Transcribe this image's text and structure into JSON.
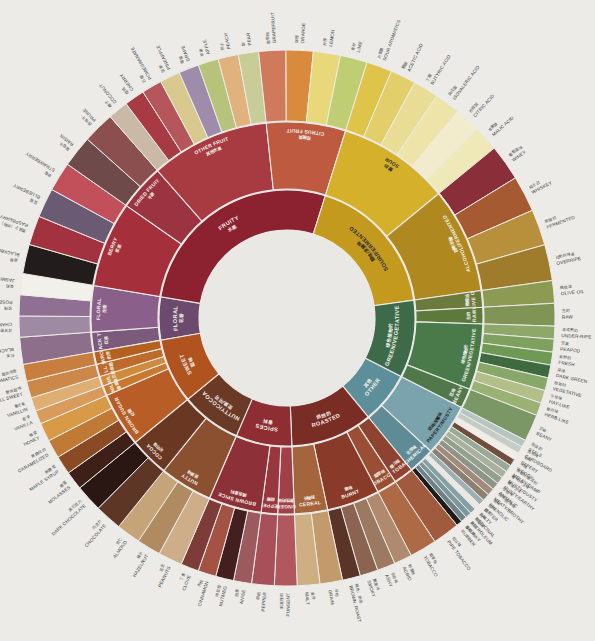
{
  "page": {
    "background_color": "#ecebe8",
    "hub_color": "#e9e8e4",
    "center_x": 287,
    "center_y": 318,
    "ring1_inner_radius": 88,
    "ring1_outer_radius": 128,
    "ring2_inner_radius": 129,
    "ring2_outer_radius": 196,
    "ring3_inner_radius": 197,
    "ring3_outer_radius": 268
  },
  "chart_data": {
    "type": "pie",
    "legend": "none",
    "grid": false,
    "rings": 3,
    "start_angle_deg": -100,
    "categories": [
      "FLORAL",
      "FRUITY",
      "SOUR/FERMENTED",
      "GREEN/VEGETATIVE",
      "OTHER",
      "ROASTED",
      "SPICES",
      "NUTTY/COCOA",
      "SWEET"
    ],
    "values": [
      20,
      100,
      66,
      36,
      24,
      38,
      26,
      28,
      30
    ],
    "xlabel": "",
    "ylabel": ""
  },
  "wheel": {
    "ring1": [
      {
        "en": "FLORAL",
        "zh": "花香",
        "color": "#6c4a6e",
        "span": 20,
        "children": [
          {
            "en": "BLACK TEA",
            "zh": "红茶",
            "color": "#7c5a7c",
            "span": 6,
            "leaves": [
              {
                "en": "BLACK TEA",
                "zh": "红茶",
                "color": "#8d6f8c"
              }
            ]
          },
          {
            "en": "FLORAL",
            "zh": "花香",
            "color": "#8a5f8a",
            "span": 14,
            "leaves": [
              {
                "en": "CHAMOMILE",
                "zh": "洋甘菊",
                "color": "#9e8aa2"
              },
              {
                "en": "ROSE",
                "zh": "玫瑰",
                "color": "#8f6f92"
              },
              {
                "en": "JASMINE",
                "zh": "茉莉",
                "color": "#f2f0ea"
              }
            ]
          }
        ]
      },
      {
        "en": "FRUITY",
        "zh": "水果",
        "color": "#8c2230",
        "span": 100,
        "children": [
          {
            "en": "BERRY",
            "zh": "浆果",
            "color": "#a5303c",
            "span": 26,
            "leaves": [
              {
                "en": "BLACKBERRY",
                "zh": "黑莓",
                "color": "#231c1d"
              },
              {
                "en": "RASPBERRY",
                "zh": "覆盆子（树莓）",
                "color": "#a33241"
              },
              {
                "en": "BLUEBERRY",
                "zh": "蓝莓",
                "color": "#6a5a74"
              },
              {
                "en": "STRAWBERRY",
                "zh": "草莓",
                "color": "#c2505a"
              }
            ]
          },
          {
            "en": "DRIED FRUIT",
            "zh": "干果",
            "color": "#9b3440",
            "span": 14,
            "leaves": [
              {
                "en": "RAISIN",
                "zh": "葡萄干",
                "color": "#6e4a4a"
              },
              {
                "en": "PRUNE",
                "zh": "西梅干",
                "color": "#8c4f4f"
              }
            ]
          },
          {
            "en": "OTHER FRUIT",
            "zh": "其他水果",
            "color": "#a83a42",
            "span": 36,
            "leaves": [
              {
                "en": "COCONUT",
                "zh": "椰子",
                "color": "#c9b9a6"
              },
              {
                "en": "CHERRY",
                "zh": "樱桃",
                "color": "#a83a44"
              },
              {
                "en": "POMEGRANATE",
                "zh": "石榴",
                "color": "#b4565a"
              },
              {
                "en": "PINEAPPLE",
                "zh": "菠萝",
                "color": "#d9c98e"
              },
              {
                "en": "GRAPE",
                "zh": "葡萄",
                "color": "#9e8caa"
              },
              {
                "en": "APPLE",
                "zh": "苹果",
                "color": "#b7c27a"
              },
              {
                "en": "PEACH",
                "zh": "桃子",
                "color": "#e0b27e"
              },
              {
                "en": "PEAR",
                "zh": "梨",
                "color": "#c8cc96"
              }
            ]
          },
          {
            "en": "CITRUS FRUIT",
            "zh": "柑橘类",
            "color": "#bd5a40",
            "span": 24,
            "leaves": [
              {
                "en": "GRAPEFRUIT",
                "zh": "葡萄柚",
                "color": "#d07a5c"
              },
              {
                "en": "ORANGE",
                "zh": "柳橙",
                "color": "#d98a3c"
              },
              {
                "en": "LEMON",
                "zh": "柠檬",
                "color": "#e8d87a"
              },
              {
                "en": "LIME",
                "zh": "青柠",
                "color": "#bfce72"
              }
            ]
          }
        ]
      },
      {
        "en": "SOUR/FERMENTED",
        "zh": "酸味/发酵味",
        "color": "#c49a1e",
        "span": 66,
        "children": [
          {
            "en": "SOUR",
            "zh": "酸的",
            "color": "#d5b02a",
            "span": 34,
            "leaves": [
              {
                "en": "SOUR AROMATICS",
                "zh": "方香酸",
                "color": "#dfc44a"
              },
              {
                "en": "ACETIC ACID",
                "zh": "醋酸",
                "color": "#e2cf6a"
              },
              {
                "en": "BUTYRIC ACID",
                "zh": "丁酸",
                "color": "#e9dc94"
              },
              {
                "en": "ISOVALERIC ACID",
                "zh": "异戊酸",
                "color": "#eee3a8"
              },
              {
                "en": "CITRIC ACID",
                "zh": "柠檬酸",
                "color": "#f2eccd"
              },
              {
                "en": "MALIC ACID",
                "zh": "苹果酸",
                "color": "#efe9b8"
              }
            ]
          },
          {
            "en": "ALCOHOL/FERMENTED",
            "zh": "酒精/发酵",
            "color": "#b08820",
            "span": 32,
            "leaves": [
              {
                "en": "WINEY",
                "zh": "葡萄酒味",
                "color": "#8a2e3a"
              },
              {
                "en": "WHISKEY",
                "zh": "威士忌",
                "color": "#a65a32"
              },
              {
                "en": "FERMENTED",
                "zh": "发酵的",
                "color": "#b8903c"
              },
              {
                "en": "OVERRIPE",
                "zh": "过熟的味道",
                "color": "#9e7c2c"
              }
            ]
          }
        ]
      },
      {
        "en": "GREEN/VEGETATIVE",
        "zh": "绿色植物的",
        "color": "#3d6a48",
        "span": 36,
        "children": [
          {
            "en": "OLIVE OIL",
            "zh": "橄榄油",
            "color": "#6c7a3c",
            "span": 5,
            "leaves": [
              {
                "en": "OLIVE OIL",
                "zh": "橄榄油",
                "color": "#8d9a52"
              }
            ]
          },
          {
            "en": "RAW",
            "zh": "生的",
            "color": "#5d7a3c",
            "span": 5,
            "leaves": [
              {
                "en": "RAW",
                "zh": "生的",
                "color": "#7f9455"
              }
            ]
          },
          {
            "en": "GREEN/VEGETATIVE",
            "zh": "绿色植物的",
            "color": "#4a7a4a",
            "span": 20,
            "leaves": [
              {
                "en": "UNDER-RIPE",
                "zh": "未成熟的",
                "color": "#8ea86a"
              },
              {
                "en": "PEAPOD",
                "zh": "豆荚",
                "color": "#7fa05e"
              },
              {
                "en": "FRESH",
                "zh": "新鲜的",
                "color": "#6f9a56"
              },
              {
                "en": "DARK GREEN",
                "zh": "深绿",
                "color": "#3f6a3f"
              },
              {
                "en": "VEGETATIVE",
                "zh": "植物的",
                "color": "#87a868"
              },
              {
                "en": "HAY-LIKE",
                "zh": "干草味",
                "color": "#b2bf88"
              },
              {
                "en": "HERB-LIKE",
                "zh": "草药味",
                "color": "#9bb174"
              }
            ]
          },
          {
            "en": "BEANY",
            "zh": "豆味",
            "color": "#51784a",
            "span": 6,
            "leaves": [
              {
                "en": "BEANY",
                "zh": "豆味",
                "color": "#7b9766"
              }
            ]
          }
        ]
      },
      {
        "en": "OTHER",
        "zh": "其他",
        "color": "#5d8f9a",
        "span": 24,
        "children": [
          {
            "en": "PAPERY/MUSTY",
            "zh": "纸味/发霉味",
            "color": "#7aa3ad",
            "span": 16,
            "leaves": [
              {
                "en": "STALE",
                "zh": "陈腐的",
                "color": "#b6c4c2"
              },
              {
                "en": "CARDBOARD",
                "zh": "纸板味",
                "color": "#c5ccc4"
              },
              {
                "en": "PAPERY",
                "zh": "纸味",
                "color": "#f0eee6"
              },
              {
                "en": "WOODY",
                "zh": "木味",
                "color": "#6f4f3c"
              },
              {
                "en": "MOLDY/DAMP",
                "zh": "发霉的/潮湿的",
                "color": "#9aa898"
              },
              {
                "en": "MUSTY/DUSTY",
                "zh": "霉味/灰尘味",
                "color": "#aab0a0"
              },
              {
                "en": "MUSTY/EARTHY",
                "zh": "霉味/土味",
                "color": "#93a08c"
              },
              {
                "en": "ANIMALIC",
                "zh": "动物味",
                "color": "#8e9487"
              },
              {
                "en": "MEATY/BROTHY",
                "zh": "肉味/肉汤味",
                "color": "#a08b7a"
              },
              {
                "en": "PHENOLIC",
                "zh": "酚味",
                "color": "#8c8070"
              }
            ]
          },
          {
            "en": "CHEMICAL",
            "zh": "化学味",
            "color": "#5f8b97",
            "span": 8,
            "leaves": [
              {
                "en": "BITTER",
                "zh": "苦的",
                "color": "#9cb0b4"
              },
              {
                "en": "SALTY",
                "zh": "咸的",
                "color": "#eae8e0"
              },
              {
                "en": "MEDICINAL",
                "zh": "药味",
                "color": "#87a0a6"
              },
              {
                "en": "PETROLEUM",
                "zh": "石油味",
                "color": "#7d969c"
              },
              {
                "en": "SKUNKY",
                "zh": "臭味",
                "color": "#6f8288"
              },
              {
                "en": "RUBBER",
                "zh": "橡胶味",
                "color": "#1d1c1a"
              }
            ]
          }
        ]
      },
      {
        "en": "ROASTED",
        "zh": "烘焙的",
        "color": "#7a2d24",
        "span": 38,
        "children": [
          {
            "en": "PIPE TOBACCO",
            "zh": "烟斗味",
            "color": "#8e4330",
            "span": 6,
            "leaves": [
              {
                "en": "PIPE TOBACCO",
                "zh": "烟斗味",
                "color": "#a05a3e"
              }
            ]
          },
          {
            "en": "TOBACCO",
            "zh": "烟草味",
            "color": "#9a4f34",
            "span": 6,
            "leaves": [
              {
                "en": "TOBACCO",
                "zh": "烟草味",
                "color": "#ae6a44"
              }
            ]
          },
          {
            "en": "BURNT",
            "zh": "焦味",
            "color": "#8a3a28",
            "span": 16,
            "leaves": [
              {
                "en": "ACRID",
                "zh": "刺激味",
                "color": "#b08a6e"
              },
              {
                "en": "ASHY",
                "zh": "灰烬味",
                "color": "#9c7a62"
              },
              {
                "en": "SMOKY",
                "zh": "烟熏味",
                "color": "#8a6450"
              },
              {
                "en": "BROWN, ROAST",
                "zh": "褐色、烘焙",
                "color": "#5a3426"
              }
            ]
          },
          {
            "en": "CEREAL",
            "zh": "谷物味",
            "color": "#a4643c",
            "span": 10,
            "leaves": [
              {
                "en": "GRAIN",
                "zh": "谷物",
                "color": "#c39a6c"
              },
              {
                "en": "MALT",
                "zh": "麦芽",
                "color": "#cfae82"
              }
            ]
          }
        ]
      },
      {
        "en": "SPICES",
        "zh": "香料",
        "color": "#8f2e32",
        "span": 26,
        "children": [
          {
            "en": "PUNGENT",
            "zh": "刺激性的味道",
            "color": "#a04048",
            "span": 5,
            "leaves": [
              {
                "en": "PUNGENT",
                "zh": "刺激性的",
                "color": "#b0585e"
              }
            ]
          },
          {
            "en": "PEPPER",
            "zh": "胡椒",
            "color": "#98373e",
            "span": 5,
            "leaves": [
              {
                "en": "PEPPER",
                "zh": "胡椒",
                "color": "#a8505a"
              }
            ]
          },
          {
            "en": "BROWN SPICE",
            "zh": "褐色香料",
            "color": "#8e3038",
            "span": 16,
            "leaves": [
              {
                "en": "ANISE",
                "zh": "茴香",
                "color": "#9c5a5e"
              },
              {
                "en": "NUTMEG",
                "zh": "肉豆蔻",
                "color": "#43201f"
              },
              {
                "en": "CINNAMON",
                "zh": "肉桂",
                "color": "#a45244"
              },
              {
                "en": "CLOVE",
                "zh": "丁香",
                "color": "#7e3c38"
              }
            ]
          }
        ]
      },
      {
        "en": "NUTTY/COCOA",
        "zh": "坚果/可可",
        "color": "#6b3a26",
        "span": 28,
        "children": [
          {
            "en": "NUTTY",
            "zh": "坚果味",
            "color": "#8a5030",
            "span": 16,
            "leaves": [
              {
                "en": "PEANUTS",
                "zh": "花生",
                "color": "#cdae88"
              },
              {
                "en": "HAZELNUT",
                "zh": "榛子",
                "color": "#b08a60"
              },
              {
                "en": "ALMOND",
                "zh": "杏仁",
                "color": "#c4a478"
              }
            ]
          },
          {
            "en": "COCOA",
            "zh": "可可味",
            "color": "#6a3822",
            "span": 12,
            "leaves": [
              {
                "en": "CHOCOLATE",
                "zh": "巧克力",
                "color": "#5e3626"
              },
              {
                "en": "DARK CHOCOLATE",
                "zh": "黑巧克力",
                "color": "#2a1714"
              }
            ]
          }
        ]
      },
      {
        "en": "SWEET",
        "zh": "甜味",
        "color": "#b0531f",
        "span": 30,
        "children": [
          {
            "en": "BROWN SUGAR",
            "zh": "红糖",
            "color": "#b85d26",
            "span": 22,
            "leaves": [
              {
                "en": "MOLASSES",
                "zh": "糖蜜",
                "color": "#3f2018"
              },
              {
                "en": "MAPLE SYRUP",
                "zh": "枫糖浆",
                "color": "#8a4a24"
              },
              {
                "en": "CARAMELIZED",
                "zh": "焦糖化的",
                "color": "#c07a36"
              },
              {
                "en": "HONEY",
                "zh": "蜂蜜",
                "color": "#d89a46"
              }
            ]
          },
          {
            "en": "VANILLA",
            "zh": "香草",
            "color": "#c8792e",
            "span": 4,
            "leaves": [
              {
                "en": "VANILLA",
                "zh": "香草",
                "color": "#d89b5c"
              }
            ]
          },
          {
            "en": "VANILLIN",
            "zh": "香兰素",
            "color": "#cf8a3c",
            "span": 4,
            "leaves": [
              {
                "en": "VANILLIN",
                "zh": "香兰素",
                "color": "#dfae72"
              }
            ]
          },
          {
            "en": "OVERALL SWEET",
            "zh": "整体甜味",
            "color": "#bd6a2a",
            "span": 5,
            "leaves": [
              {
                "en": "OVERALL SWEET",
                "zh": "整体甜味",
                "color": "#cc8848"
              }
            ]
          },
          {
            "en": "SWEET AROMATICS",
            "zh": "甜的芳香",
            "color": "#b5601f",
            "span": 5,
            "leaves": [
              {
                "en": "SWEET AROMATICS",
                "zh": "甜的芳香",
                "color": "#c77e3e"
              }
            ]
          }
        ]
      }
    ]
  }
}
